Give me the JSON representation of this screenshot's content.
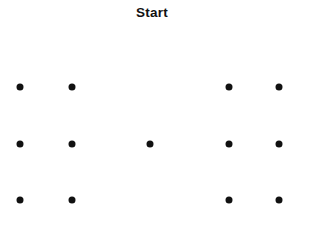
{
  "canvas": {
    "width": 310,
    "height": 230,
    "background_color": "#ffffff"
  },
  "header": {
    "title": "Start",
    "title_color": "#121212"
  },
  "stimulus": {
    "dot_color": "#111111",
    "dot_diameter": 7,
    "columns_x": [
      20,
      72,
      150,
      229,
      279
    ],
    "rows_y": [
      87,
      144,
      200
    ],
    "grid_pattern": [
      [
        1,
        1,
        0,
        1,
        1
      ],
      [
        1,
        1,
        1,
        1,
        1
      ],
      [
        1,
        1,
        0,
        1,
        1
      ]
    ],
    "dots": [
      {
        "label": "dot-r1-c1",
        "x": 20,
        "y": 87
      },
      {
        "label": "dot-r1-c2",
        "x": 72,
        "y": 87
      },
      {
        "label": "dot-r1-c4",
        "x": 229,
        "y": 87
      },
      {
        "label": "dot-r1-c5",
        "x": 279,
        "y": 87
      },
      {
        "label": "dot-r2-c1",
        "x": 20,
        "y": 144
      },
      {
        "label": "dot-r2-c2",
        "x": 72,
        "y": 144
      },
      {
        "label": "dot-r2-c3",
        "x": 150,
        "y": 144
      },
      {
        "label": "dot-r2-c4",
        "x": 229,
        "y": 144
      },
      {
        "label": "dot-r2-c5",
        "x": 279,
        "y": 144
      },
      {
        "label": "dot-r3-c1",
        "x": 20,
        "y": 200
      },
      {
        "label": "dot-r3-c2",
        "x": 72,
        "y": 200
      },
      {
        "label": "dot-r3-c4",
        "x": 229,
        "y": 200
      },
      {
        "label": "dot-r3-c5",
        "x": 279,
        "y": 200
      }
    ],
    "dot_count": 13
  }
}
